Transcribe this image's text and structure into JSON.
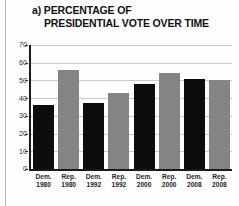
{
  "figure": {
    "panel_letter": "a)",
    "title_line1": "a) PERCENTAGE OF",
    "title_line2": "PRESIDENTIAL VOTE OVER TIME"
  },
  "colors": {
    "democrat_bar": "#0d0d0d",
    "republican_bar": "#848484",
    "gridline": "#c9c9c9",
    "axis": "#1a1a1a",
    "background": "#fdfdfd"
  },
  "axis": {
    "y_ticks": [
      "0",
      "10",
      "20",
      "30",
      "40",
      "50",
      "60",
      "70"
    ]
  },
  "chart_data": {
    "type": "bar",
    "title": "a) PERCENTAGE OF PRESIDENTIAL VOTE OVER TIME",
    "xlabel": "",
    "ylabel": "",
    "ylim": [
      0,
      70
    ],
    "ytick_step": 10,
    "grid": true,
    "legend": "none",
    "categories": [
      "Dem. 1980",
      "Rep. 1980",
      "Dem. 1992",
      "Rep. 1992",
      "Dem. 2000",
      "Rep. 2000",
      "Dem. 2008",
      "Rep. 2008"
    ],
    "category_party": [
      "Dem.",
      "Rep.",
      "Dem.",
      "Rep.",
      "Dem.",
      "Rep.",
      "Dem.",
      "Rep."
    ],
    "category_year": [
      "1980",
      "1980",
      "1992",
      "1992",
      "2000",
      "2000",
      "2008",
      "2008"
    ],
    "values": [
      36,
      56,
      37,
      43,
      48,
      54,
      51,
      50
    ]
  }
}
